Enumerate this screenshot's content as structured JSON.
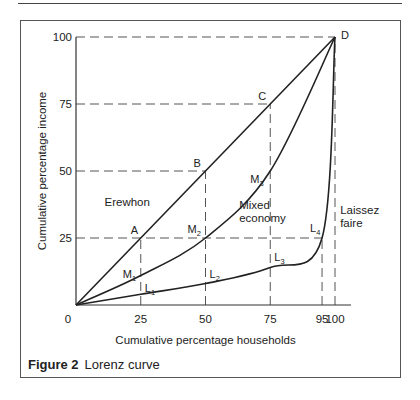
{
  "figure": {
    "caption_label": "Figure 2",
    "caption_text": "Lorenz curve"
  },
  "chart_data": {
    "type": "line",
    "title": "Lorenz curve",
    "xlabel": "Cumulative percentage households",
    "ylabel": "Cumulative percentage income",
    "xlim": [
      0,
      100
    ],
    "ylim": [
      0,
      100
    ],
    "x_ticks": [
      {
        "value": 0,
        "label": "0"
      },
      {
        "value": 25,
        "label": "25"
      },
      {
        "value": 50,
        "label": "50"
      },
      {
        "value": 75,
        "label": "75"
      },
      {
        "value": 95,
        "label": "95"
      },
      {
        "value": 100,
        "label": "100"
      }
    ],
    "y_ticks": [
      {
        "value": 25,
        "label": "25"
      },
      {
        "value": 50,
        "label": "50"
      },
      {
        "value": 75,
        "label": "75"
      },
      {
        "value": 100,
        "label": "100"
      }
    ],
    "series": [
      {
        "name": "Erewhon",
        "x": [
          0,
          100
        ],
        "y": [
          0,
          100
        ]
      },
      {
        "name": "Mixed economy",
        "x": [
          0,
          25,
          50,
          75,
          100
        ],
        "y": [
          0,
          11,
          25,
          50,
          100
        ]
      },
      {
        "name": "Laissez faire",
        "x": [
          0,
          25,
          50,
          75,
          95,
          100
        ],
        "y": [
          0,
          4,
          8,
          14,
          25,
          100
        ]
      }
    ],
    "guides": {
      "horizontal": [
        {
          "y": 25,
          "x_to": 95
        },
        {
          "y": 50,
          "x_to": 50
        },
        {
          "y": 75,
          "x_to": 75
        },
        {
          "y": 100,
          "x_to": 100
        }
      ],
      "vertical": [
        {
          "x": 25,
          "y_to": 25
        },
        {
          "x": 50,
          "y_to": 50
        },
        {
          "x": 75,
          "y_to": 75
        },
        {
          "x": 95,
          "y_to": 25
        },
        {
          "x": 100,
          "y_to": 100
        }
      ]
    },
    "point_labels": [
      {
        "text": "A",
        "x": 25,
        "y": 25,
        "dx": -10,
        "dy": -4
      },
      {
        "text": "B",
        "x": 50,
        "y": 50,
        "dx": -12,
        "dy": -4
      },
      {
        "text": "C",
        "x": 75,
        "y": 75,
        "dx": -12,
        "dy": -4
      },
      {
        "text": "D",
        "x": 100,
        "y": 100,
        "dx": 6,
        "dy": 2
      },
      {
        "text": "M",
        "sub": "1",
        "x": 25,
        "y": 11,
        "dx": -18,
        "dy": 2
      },
      {
        "text": "M",
        "sub": "2",
        "x": 50,
        "y": 25,
        "dx": -18,
        "dy": -5
      },
      {
        "text": "M",
        "sub": "3",
        "x": 75,
        "y": 50,
        "dx": -20,
        "dy": 12
      },
      {
        "text": "L",
        "sub": "1",
        "x": 25,
        "y": 4,
        "dx": 4,
        "dy": -2
      },
      {
        "text": "L",
        "sub": "2",
        "x": 50,
        "y": 8,
        "dx": 4,
        "dy": -6
      },
      {
        "text": "L",
        "sub": "3",
        "x": 75,
        "y": 14,
        "dx": 4,
        "dy": -6
      },
      {
        "text": "L",
        "sub": "4",
        "x": 95,
        "y": 25,
        "dx": -12,
        "dy": -6
      }
    ],
    "annotations": [
      {
        "text": "Erewhon",
        "x": 11,
        "y": 37
      },
      {
        "text": "Mixed",
        "x": 63,
        "y": 36
      },
      {
        "text": "economy",
        "x": 63,
        "y": 31
      },
      {
        "text": "Laissez",
        "x": 102,
        "y": 34
      },
      {
        "text": "faire",
        "x": 102,
        "y": 29
      }
    ],
    "grid": false,
    "legend": "none"
  }
}
